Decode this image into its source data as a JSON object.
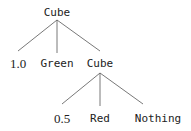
{
  "diagram": {
    "type": "tree",
    "line_color": "#555555",
    "root": {
      "label": "Cube",
      "children": [
        {
          "label": "1.0"
        },
        {
          "label": "Green"
        },
        {
          "label": "Cube",
          "children": [
            {
              "label": "0.5"
            },
            {
              "label": "Red"
            },
            {
              "label": "Nothing"
            }
          ]
        }
      ]
    }
  }
}
